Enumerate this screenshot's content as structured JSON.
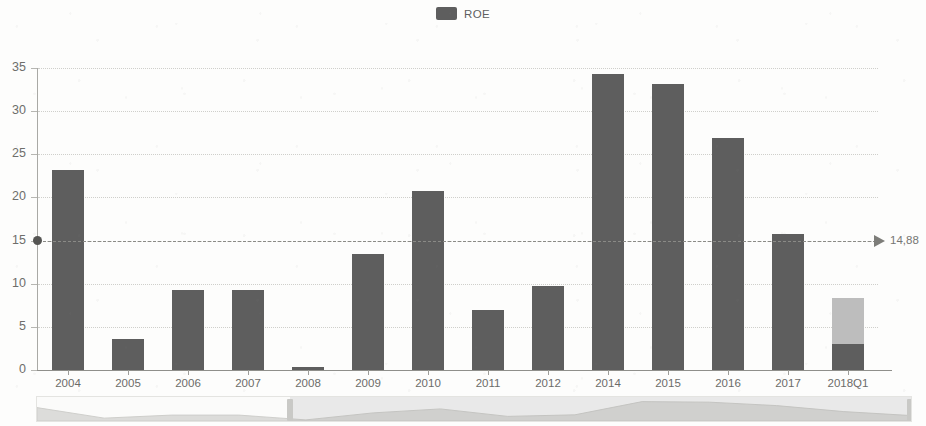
{
  "legend": {
    "position": "top-center",
    "items": [
      {
        "label": "ROE",
        "color": "#5e5e5e",
        "icon": "legend-swatch"
      }
    ]
  },
  "annotation": {
    "value_label": "14,88",
    "marker_icon": "reference-dot",
    "arrow_icon": "arrow-right-icon"
  },
  "datazoom": {
    "start_label": "2006",
    "end_label": "2018Q1",
    "start_pct": 29,
    "end_pct": 100
  },
  "chart_data": {
    "type": "bar",
    "title": "",
    "subtitle": "",
    "xlabel": "",
    "ylabel": "",
    "ylim": [
      0,
      35
    ],
    "yticks": [
      0,
      5,
      10,
      15,
      20,
      25,
      30,
      35
    ],
    "ytick_labels": [
      "0",
      "5",
      "10",
      "15",
      "20",
      "25",
      "30",
      "35"
    ],
    "grid": true,
    "legend_position": "top-center",
    "categories": [
      "2004",
      "2005",
      "2006",
      "2007",
      "2008",
      "2009",
      "2010",
      "2011",
      "2012",
      "2014",
      "2015",
      "2016",
      "2017",
      "2018Q1"
    ],
    "series": [
      {
        "name": "ROE",
        "color": "#5e5e5e",
        "values": [
          23.2,
          3.6,
          9.3,
          9.3,
          0.3,
          13.4,
          20.7,
          6.9,
          9.7,
          34.3,
          33.2,
          26.9,
          15.8,
          3.0
        ]
      },
      {
        "name": "ROE projected remainder",
        "color": "#bdbdbd",
        "values": [
          0,
          0,
          0,
          0,
          0,
          0,
          0,
          0,
          0,
          0,
          0,
          0,
          0,
          5.4
        ]
      }
    ],
    "annotations": [
      {
        "type": "horizontal-reference-line",
        "y": 15,
        "label": "14,88",
        "style": "dashed",
        "color": "#8a8a86"
      }
    ]
  }
}
